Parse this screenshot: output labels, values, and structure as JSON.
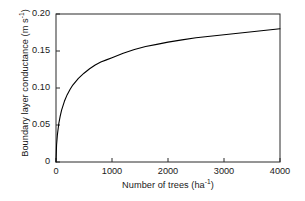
{
  "chart_data": {
    "type": "line",
    "title": "",
    "xlabel": "Number of trees (ha⁻¹)",
    "xlabel_main": "Number of trees (ha",
    "xlabel_sup": "-1",
    "xlabel_tail": ")",
    "ylabel": "Boundary layer conductance (m s⁻¹)",
    "ylabel_main": "Boundary layer conductance (m s",
    "ylabel_sup": "-1",
    "ylabel_tail": ")",
    "xlim": [
      0,
      4000
    ],
    "ylim": [
      0,
      0.2
    ],
    "xticks": [
      0,
      1000,
      2000,
      3000,
      4000
    ],
    "yticks": [
      0,
      0.05,
      0.1,
      0.15,
      0.2
    ],
    "xtick_labels": [
      "0",
      "1000",
      "2000",
      "3000",
      "4000"
    ],
    "ytick_labels": [
      "0",
      "0.05",
      "0.10",
      "0.15",
      "0.20"
    ],
    "grid": false,
    "legend": false,
    "legend_position": "none",
    "tick_direction": "in",
    "spines": [
      "left",
      "bottom",
      "top",
      "right"
    ],
    "line_color": "#000000",
    "line_width": 1.1,
    "x": [
      0,
      10,
      25,
      50,
      75,
      100,
      150,
      200,
      250,
      300,
      400,
      500,
      600,
      700,
      800,
      900,
      1000,
      1200,
      1400,
      1600,
      1800,
      2000,
      2250,
      2500,
      2750,
      3000,
      3250,
      3500,
      3750,
      4000
    ],
    "y": [
      0.0,
      0.023,
      0.037,
      0.052,
      0.062,
      0.07,
      0.082,
      0.091,
      0.098,
      0.104,
      0.113,
      0.12,
      0.126,
      0.131,
      0.135,
      0.138,
      0.141,
      0.147,
      0.152,
      0.156,
      0.159,
      0.162,
      0.165,
      0.168,
      0.17,
      0.172,
      0.174,
      0.176,
      0.178,
      0.18
    ],
    "series": [
      {
        "name": "Boundary layer conductance",
        "values": [
          0.0,
          0.023,
          0.037,
          0.052,
          0.062,
          0.07,
          0.082,
          0.091,
          0.098,
          0.104,
          0.113,
          0.12,
          0.126,
          0.131,
          0.135,
          0.138,
          0.141,
          0.147,
          0.152,
          0.156,
          0.159,
          0.162,
          0.165,
          0.168,
          0.17,
          0.172,
          0.174,
          0.176,
          0.178,
          0.18
        ]
      }
    ],
    "annotations": []
  },
  "plot_geometry": {
    "left": 56,
    "right": 280,
    "top": 14,
    "bottom": 162
  }
}
